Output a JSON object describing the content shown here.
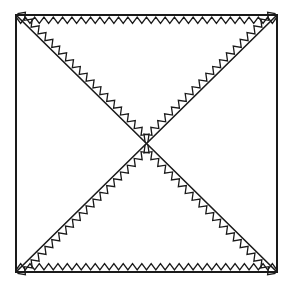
{
  "figure": {
    "type": "line-drawing",
    "canvas": {
      "width": 296,
      "height": 293
    },
    "background_color": "#ffffff",
    "stroke_color": "#1a1a1a",
    "border_stroke_width": 2.0,
    "diagonal_stroke_width": 1.6,
    "zigzag_stroke_width": 1.3,
    "square": {
      "name": "outer-square",
      "left": 16,
      "top": 15,
      "right": 277,
      "bottom": 272,
      "width": 261,
      "height": 257
    },
    "center_point": {
      "x": 146.5,
      "y": 143.5
    },
    "diagonals": [
      {
        "name": "main-diagonal",
        "from": {
          "x": 16,
          "y": 15
        },
        "to": {
          "x": 277,
          "y": 272
        }
      },
      {
        "name": "anti-diagonal",
        "from": {
          "x": 277,
          "y": 15
        },
        "to": {
          "x": 16,
          "y": 272
        }
      }
    ],
    "triangles": [
      {
        "name": "top-triangle",
        "filled_with_zigzag": true
      },
      {
        "name": "right-triangle",
        "filled_with_zigzag": false
      },
      {
        "name": "bottom-triangle",
        "filled_with_zigzag": true
      },
      {
        "name": "left-triangle",
        "filled_with_zigzag": false
      }
    ],
    "zigzag": {
      "pattern": "sawtooth",
      "amplitude_px": 6.5,
      "period_px": 9.4,
      "inset_px": 2.0,
      "teeth_top_edge": 28,
      "teeth_bottom_edge": 28,
      "teeth_per_diagonal_leg": 20,
      "runs": [
        "top-edge-inward",
        "top-triangle-left-leg",
        "top-triangle-right-leg",
        "bottom-edge-inward",
        "bottom-triangle-left-leg",
        "bottom-triangle-right-leg"
      ]
    }
  },
  "labels": {
    "figure_name": "figure-square-diagonals-zigzag",
    "alt_text": "A square divided by both diagonals into four triangles; the top and bottom triangles are outlined inside by a sawtooth zigzag line."
  }
}
